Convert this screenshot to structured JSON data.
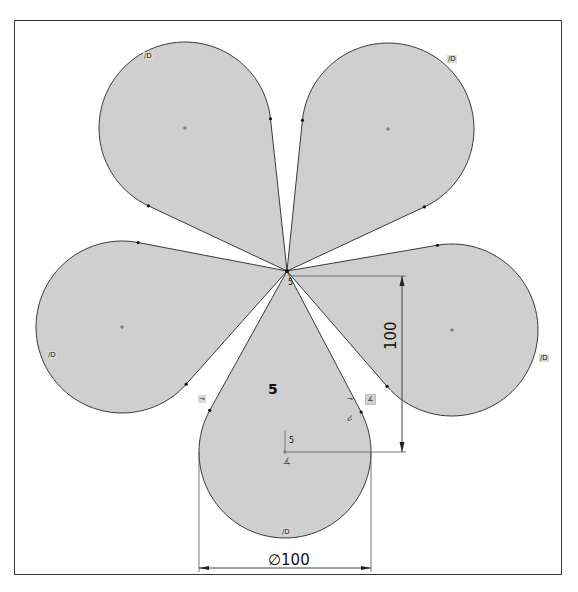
{
  "sketch": {
    "center_point": [
      287,
      271
    ],
    "petal_radius": 86,
    "fill_color": "#cfcfcf",
    "stroke_color": "#3a3a3a",
    "petals": [
      {
        "name": "petal-top-left",
        "center": [
          185,
          128
        ]
      },
      {
        "name": "petal-top-right",
        "center": [
          388,
          129
        ]
      },
      {
        "name": "petal-left",
        "center": [
          122,
          327
        ]
      },
      {
        "name": "petal-right",
        "center": [
          452,
          330
        ]
      },
      {
        "name": "petal-bottom",
        "center": [
          285,
          452
        ]
      }
    ]
  },
  "dimensions": {
    "vertical": {
      "value": "100",
      "x": 402,
      "y1": 276,
      "y2": 452
    },
    "diameter": {
      "value": "∅100",
      "y": 568,
      "x1": 199,
      "x2": 371
    },
    "count_label": "5",
    "small_value_center": "5",
    "small_value_bottom": "5"
  },
  "relation_tags": {
    "top_left": "∕D",
    "top_right": "∕D",
    "left": "∕D",
    "right": "∕D",
    "bottom": "∕D",
    "tangent_left": "⊸",
    "tangent_right": "⊸"
  }
}
